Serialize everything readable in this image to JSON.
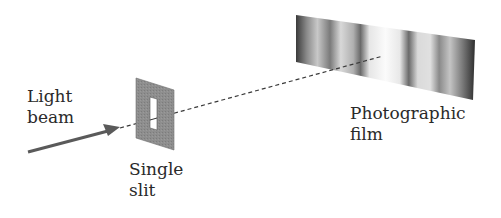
{
  "diagram": {
    "labels": {
      "light_beam": [
        "Light",
        "beam"
      ],
      "single_slit": [
        "Single",
        "slit"
      ],
      "photographic_film": [
        "Photographic",
        "film"
      ]
    },
    "components": [
      {
        "name": "light-beam-arrow",
        "description": "Incoming light beam arrow pointing toward slit"
      },
      {
        "name": "single-slit-plate",
        "description": "Gray plate with a narrow vertical slit"
      },
      {
        "name": "beam-path",
        "description": "Dashed line from slit to film"
      },
      {
        "name": "photographic-film",
        "description": "Film showing diffraction fringe pattern: bright central band with alternating dark/light fringes"
      }
    ],
    "colors": {
      "plate": "#8c8c8c",
      "arrow": "#5a5a5a",
      "text": "#2a2a2a",
      "dash": "#3a3a3a"
    }
  }
}
